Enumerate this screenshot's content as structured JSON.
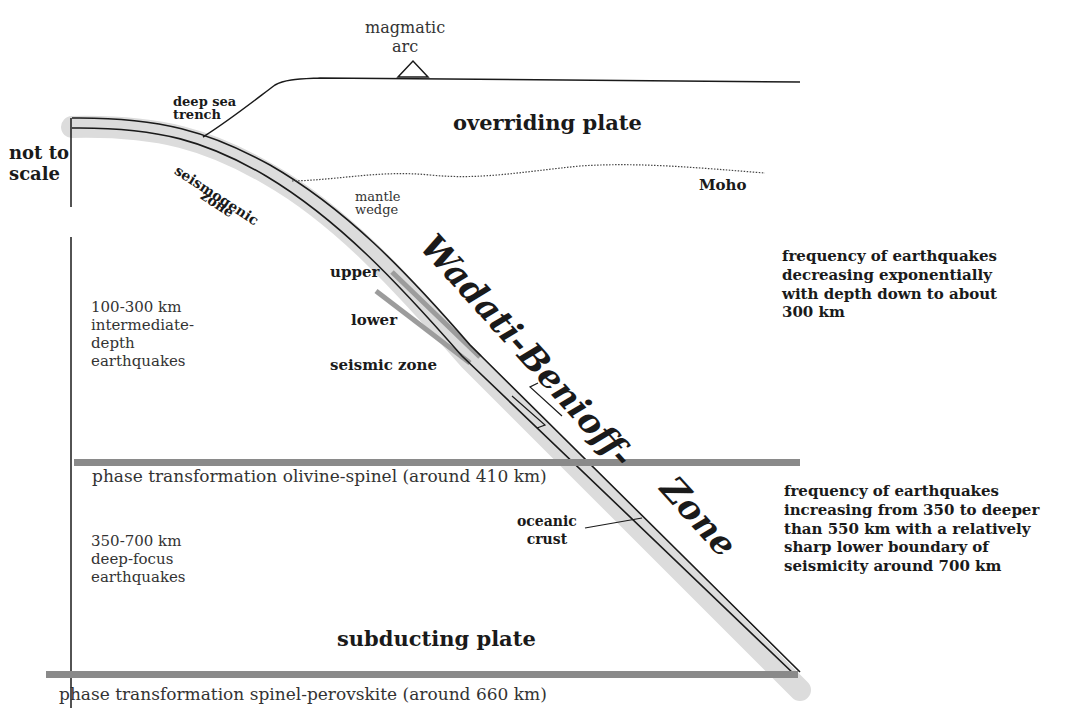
{
  "labels": {
    "magmatic_arc": "magmatic\narc",
    "deep_sea_trench": "deep sea\ntrench",
    "not_to_scale": "not to\nscale",
    "overriding_plate": "overriding plate",
    "seismogenic_zone_1": "seismogenic",
    "seismogenic_zone_2": "zone",
    "mantle_wedge": "mantle\nwedge",
    "moho": "Moho",
    "wadati_benioff": "Wadati-Benioff-",
    "zone": "Zone",
    "upper": "upper",
    "lower": "lower",
    "seismic_zone": "seismic zone",
    "intermediate_depth": "100-300 km\nintermediate-\ndepth\nearthquakes",
    "freq_decreasing": "frequency of earthquakes\ndecreasing exponentially\nwith depth down to about\n300 km",
    "phase_410": "phase transformation olivine-spinel (around 410 km)",
    "deep_focus": "350-700 km\ndeep-focus\nearthquakes",
    "oceanic_crust": "oceanic\ncrust",
    "freq_increasing": "frequency of earthquakes\nincreasing from 350 to deeper\nthan 550 km with a relatively\nsharp lower boundary of\nseismicity around 700 km",
    "subducting_plate": "subducting plate",
    "phase_660": "phase transformation spinel-perovskite (around 660 km)"
  },
  "colors": {
    "line": "#1a1a1a",
    "slab_shade": "#d9d9d9",
    "phase_boundary": "#8a8a8a",
    "double_seismic": "#999999"
  }
}
